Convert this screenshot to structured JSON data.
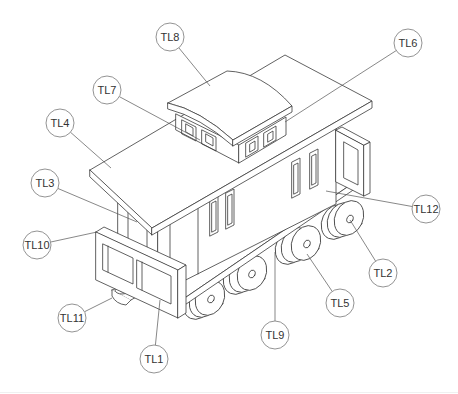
{
  "figure": {
    "line_color": "#3a3a3a",
    "bubble_stroke": "#777777",
    "background": "#ffffff"
  },
  "callouts": [
    {
      "id": "TL8",
      "label": "TL8",
      "cx": 170,
      "cy": 37,
      "r": 14,
      "tx": 210,
      "ty": 86
    },
    {
      "id": "TL6",
      "label": "TL6",
      "cx": 408,
      "cy": 43,
      "r": 14,
      "tx": 285,
      "ty": 122
    },
    {
      "id": "TL7",
      "label": "TL7",
      "cx": 107,
      "cy": 90,
      "r": 14,
      "tx": 200,
      "ty": 140
    },
    {
      "id": "TL4",
      "label": "TL4",
      "cx": 60,
      "cy": 123,
      "r": 14,
      "tx": 111,
      "ty": 168
    },
    {
      "id": "TL3",
      "label": "TL3",
      "cx": 45,
      "cy": 183,
      "r": 14,
      "tx": 137,
      "ty": 222
    },
    {
      "id": "TL10",
      "label": "TL10",
      "cx": 37,
      "cy": 245,
      "r": 14,
      "tx": 97,
      "ty": 232
    },
    {
      "id": "TL11",
      "label": "TL11",
      "cx": 72,
      "cy": 318,
      "r": 14,
      "tx": 112,
      "ty": 298
    },
    {
      "id": "TL1",
      "label": "TL1",
      "cx": 154,
      "cy": 359,
      "r": 14,
      "tx": 160,
      "ty": 300
    },
    {
      "id": "TL9",
      "label": "TL9",
      "cx": 275,
      "cy": 335,
      "r": 14,
      "tx": 275,
      "ty": 252
    },
    {
      "id": "TL5",
      "label": "TL5",
      "cx": 340,
      "cy": 303,
      "r": 14,
      "tx": 307,
      "ty": 254
    },
    {
      "id": "TL2",
      "label": "TL2",
      "cx": 383,
      "cy": 273,
      "r": 14,
      "tx": 350,
      "ty": 220
    },
    {
      "id": "TL12",
      "label": "TL12",
      "cx": 426,
      "cy": 209,
      "r": 14,
      "tx": 326,
      "ty": 191
    }
  ]
}
